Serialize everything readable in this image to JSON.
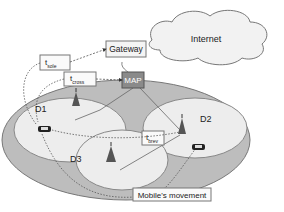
{
  "diagram": {
    "nodes": {
      "internet": "Internet",
      "gateway": "Gateway",
      "map": "MAP"
    },
    "domains": [
      "D1",
      "D2",
      "D3"
    ],
    "timers": {
      "t_sole": {
        "main": "t",
        "sub": "sole"
      },
      "t_cross": {
        "main": "t",
        "sub": "cross"
      },
      "t_brev": {
        "main": "t",
        "sub": "brev"
      }
    },
    "legend": "Mobile's movement",
    "colors": {
      "map_fill": "#8a8a8a",
      "outer_region": "#bdbdbd",
      "cell_fill": "#ededed",
      "cloud_fill": "#f2f2f2"
    }
  }
}
